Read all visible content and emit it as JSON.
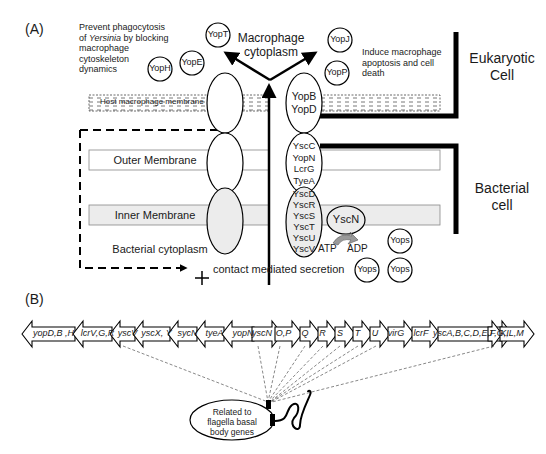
{
  "panel_a": {
    "label": "(A)",
    "left_note": [
      "Prevent phagocytosis",
      "of Yersinia by blocking",
      "macrophage cytoskeleton",
      "dynamics"
    ],
    "left_note_italic_word": "Yersinia",
    "right_note": [
      "Induce macrophage",
      "apoptosis and cell",
      "death"
    ],
    "center_title": [
      "Macrophage",
      "cytoplasm"
    ],
    "eukaryotic_label": [
      "Eukaryotic",
      "Cell"
    ],
    "bacterial_label": [
      "Bacterial",
      "cell"
    ],
    "host_membrane": "Host macrophage membrane",
    "outer_membrane": "Outer Membrane",
    "inner_membrane": "Inner Membrane",
    "bacterial_cytoplasm": "Bacterial cytoplasm",
    "secretion_label": "contact mediated secretion",
    "plus_sign": "+",
    "effectors": [
      {
        "name": "YopT",
        "x": 218,
        "y": 35
      },
      {
        "name": "YopH",
        "x": 160,
        "y": 69
      },
      {
        "name": "YopE",
        "x": 192,
        "y": 63
      },
      {
        "name": "YopJ",
        "x": 340,
        "y": 40
      },
      {
        "name": "YopP",
        "x": 337,
        "y": 73
      }
    ],
    "translocon": [
      "YopB",
      "YopD"
    ],
    "outer_ring": [
      "YscC",
      "YopN",
      "LcrG",
      "TyeA"
    ],
    "inner_ring": [
      "YscD",
      "YscR",
      "YscS",
      "YscT",
      "YscU",
      "YscV"
    ],
    "atpase": "YscN",
    "atp": "ATP",
    "adp": "ADP",
    "secreted": [
      {
        "name": "Yops",
        "x": 400,
        "y": 241
      },
      {
        "name": "Yops",
        "x": 367,
        "y": 270
      },
      {
        "name": "Yops",
        "x": 400,
        "y": 270
      }
    ]
  },
  "panel_b": {
    "label": "(B)",
    "genes": [
      {
        "name": "yopD,B ,H",
        "x1": 22,
        "x2": 75,
        "dir": "left"
      },
      {
        "name": "lcrV,G,R",
        "x1": 73,
        "x2": 112,
        "dir": "left"
      },
      {
        "name": "yscV",
        "x1": 110,
        "x2": 135,
        "dir": "left"
      },
      {
        "name": "yscX, Y",
        "x1": 133,
        "x2": 170,
        "dir": "left"
      },
      {
        "name": "sycN",
        "x1": 168,
        "x2": 197,
        "dir": "left"
      },
      {
        "name": "tyeA",
        "x1": 195,
        "x2": 224,
        "dir": "left"
      },
      {
        "name": "yopN",
        "x1": 222,
        "x2": 254,
        "dir": "left"
      },
      {
        "name": "yscN",
        "x1": 252,
        "x2": 282,
        "dir": "right"
      },
      {
        "name": "O,P",
        "x1": 275,
        "x2": 302,
        "dir": "right"
      },
      {
        "name": "Q",
        "x1": 300,
        "x2": 320,
        "dir": "right"
      },
      {
        "name": "R",
        "x1": 318,
        "x2": 337,
        "dir": "right"
      },
      {
        "name": "S",
        "x1": 335,
        "x2": 355,
        "dir": "right"
      },
      {
        "name": "T",
        "x1": 353,
        "x2": 372,
        "dir": "right"
      },
      {
        "name": "U",
        "x1": 370,
        "x2": 390,
        "dir": "right"
      },
      {
        "name": "virG",
        "x1": 388,
        "x2": 414,
        "dir": "right"
      },
      {
        "name": "lcrF",
        "x1": 412,
        "x2": 440,
        "dir": "right"
      },
      {
        "name": "yscA,B,C,D,E,F,G,I",
        "x1": 438,
        "x2": 512,
        "dir": "right"
      },
      {
        "name": "J",
        "x1": 488,
        "x2": 502,
        "dir": "right"
      },
      {
        "name": "K,L,M",
        "x1": 500,
        "x2": 534,
        "dir": "right"
      }
    ],
    "flagella_note": [
      "Related to",
      "flagella basal",
      "body genes"
    ]
  }
}
